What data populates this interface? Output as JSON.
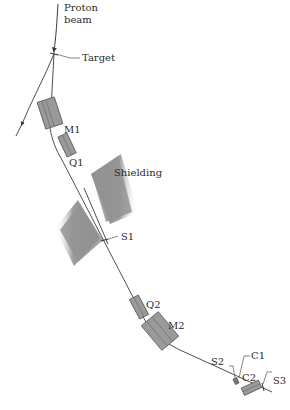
{
  "diagram": {
    "labels": {
      "proton_beam_line1": "Proton",
      "proton_beam_line2": "beam",
      "target": "Target",
      "m1": "M1",
      "q1": "Q1",
      "shielding": "Shielding",
      "s1": "S1",
      "q2": "Q2",
      "m2": "M2",
      "s2": "S2",
      "c1": "C1",
      "c2": "C2",
      "s3": "S3"
    },
    "colors": {
      "background": "#ffffff",
      "beam_line": "#3a3a3a",
      "magnet_fill": "#9a9a9a",
      "shielding_fill": "#8c8c8c",
      "text": "#2b2b2b"
    }
  }
}
